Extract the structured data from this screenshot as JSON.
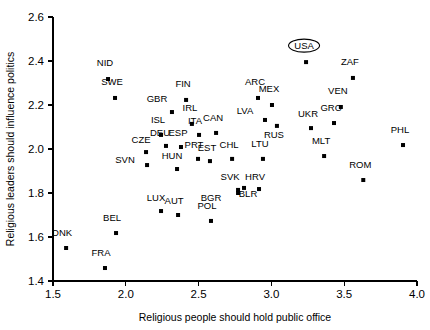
{
  "chart_data": {
    "type": "scatter",
    "title": "",
    "xlabel": "Religious people should hold public office",
    "ylabel": "Religious leaders should influence politics",
    "xlim": [
      1.5,
      4.0
    ],
    "ylim": [
      1.4,
      2.6
    ],
    "xticks": [
      "1.5",
      "2.0",
      "2.5",
      "3.0",
      "3.5",
      "4.0"
    ],
    "xtickvalues": [
      1.5,
      2.0,
      2.5,
      3.0,
      3.5,
      4.0
    ],
    "yticks": [
      "1.4",
      "1.6",
      "1.8",
      "2.0",
      "2.2",
      "2.4",
      "2.6"
    ],
    "ytickvalues": [
      1.4,
      1.6,
      1.8,
      2.0,
      2.2,
      2.4,
      2.6
    ],
    "grid": false,
    "legend": false,
    "marker": "square",
    "marker_color": "#000000",
    "highlighted_point": "USA",
    "highlight_style": "ellipse-around-label",
    "points": [
      {
        "label": "NID",
        "x": 1.878,
        "y": 2.318,
        "lx": -3,
        "ly": -13
      },
      {
        "label": "SWE",
        "x": 1.926,
        "y": 2.232,
        "lx": -3,
        "ly": -13
      },
      {
        "label": "FIN",
        "x": 2.414,
        "y": 2.223,
        "lx": -3,
        "ly": -13
      },
      {
        "label": "GBR",
        "x": 2.317,
        "y": 2.168,
        "lx": -15,
        "ly": -10
      },
      {
        "label": "IRL",
        "x": 2.454,
        "y": 2.114,
        "lx": -2,
        "ly": -13
      },
      {
        "label": "ARC",
        "x": 2.908,
        "y": 2.232,
        "lx": -3,
        "ly": -13
      },
      {
        "label": "MEX",
        "x": 3.004,
        "y": 2.2,
        "lx": -3,
        "ly": -13
      },
      {
        "label": "LVA",
        "x": 2.956,
        "y": 2.132,
        "lx": -20,
        "ly": -6
      },
      {
        "label": "RUS",
        "x": 3.038,
        "y": 2.105,
        "lx": -3,
        "ly": 12
      },
      {
        "label": "UKR",
        "x": 3.272,
        "y": 2.095,
        "lx": -3,
        "ly": -11
      },
      {
        "label": "GRC",
        "x": 3.43,
        "y": 2.118,
        "lx": -3,
        "ly": -12
      },
      {
        "label": "USA",
        "x": 3.238,
        "y": 2.395,
        "lx": -2,
        "ly": -13
      },
      {
        "label": "ZAF",
        "x": 3.56,
        "y": 2.323,
        "lx": -3,
        "ly": -13
      },
      {
        "label": "VEN",
        "x": 3.477,
        "y": 2.191,
        "lx": -3,
        "ly": -13
      },
      {
        "label": "ISL",
        "x": 2.242,
        "y": 2.064,
        "lx": -3,
        "ly": -12
      },
      {
        "label": "ITA",
        "x": 2.503,
        "y": 2.064,
        "lx": -4,
        "ly": -11
      },
      {
        "label": "CAN",
        "x": 2.62,
        "y": 2.073,
        "lx": -3,
        "ly": -12
      },
      {
        "label": "DEU",
        "x": 2.276,
        "y": 2.014,
        "lx": -6,
        "ly": -10
      },
      {
        "label": "ESP",
        "x": 2.379,
        "y": 2.009,
        "lx": -3,
        "ly": -11
      },
      {
        "label": "CZE",
        "x": 2.139,
        "y": 1.986,
        "lx": -5,
        "ly": -9
      },
      {
        "label": "PRT",
        "x": 2.496,
        "y": 1.955,
        "lx": -4,
        "ly": -11
      },
      {
        "label": "SVN",
        "x": 2.146,
        "y": 1.927,
        "lx": -22,
        "ly": -2
      },
      {
        "label": "HUN",
        "x": 2.352,
        "y": 1.909,
        "lx": -5,
        "ly": -10
      },
      {
        "label": "EST",
        "x": 2.578,
        "y": 1.945,
        "lx": -3,
        "ly": -10
      },
      {
        "label": "CHL",
        "x": 2.73,
        "y": 1.955,
        "lx": -3,
        "ly": -11
      },
      {
        "label": "LTU",
        "x": 2.942,
        "y": 1.955,
        "lx": -3,
        "ly": -12
      },
      {
        "label": "MLT",
        "x": 3.362,
        "y": 1.968,
        "lx": -3,
        "ly": -12
      },
      {
        "label": "PHL",
        "x": 3.904,
        "y": 2.018,
        "lx": -3,
        "ly": -12
      },
      {
        "label": "ROM",
        "x": 3.631,
        "y": 1.859,
        "lx": -3,
        "ly": -12
      },
      {
        "label": "SVK",
        "x": 2.771,
        "y": 1.814,
        "lx": -8,
        "ly": -10
      },
      {
        "label": "BLR",
        "x": 2.812,
        "y": 1.823,
        "lx": 4,
        "ly": 9
      },
      {
        "label": "BGR",
        "x": 2.771,
        "y": 1.8,
        "lx": -27,
        "ly": 8
      },
      {
        "label": "HRV",
        "x": 2.915,
        "y": 1.818,
        "lx": -4,
        "ly": -9
      },
      {
        "label": "LUX",
        "x": 2.242,
        "y": 1.718,
        "lx": -5,
        "ly": -10
      },
      {
        "label": "AUT",
        "x": 2.359,
        "y": 1.7,
        "lx": -4,
        "ly": -11
      },
      {
        "label": "POL",
        "x": 2.585,
        "y": 1.673,
        "lx": -4,
        "ly": -12
      },
      {
        "label": "BEL",
        "x": 1.933,
        "y": 1.618,
        "lx": -4,
        "ly": -12
      },
      {
        "label": "DNK",
        "x": 1.59,
        "y": 1.55,
        "lx": -4,
        "ly": -12
      },
      {
        "label": "FRA",
        "x": 1.857,
        "y": 1.459,
        "lx": -4,
        "ly": -12
      }
    ]
  }
}
